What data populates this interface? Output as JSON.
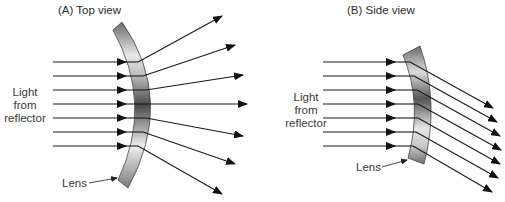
{
  "figure": {
    "panels": [
      {
        "id": "A",
        "title": "(A)  Top view",
        "source_label": [
          "Light",
          "from",
          "reflector"
        ],
        "lens_label": "Lens",
        "ray_count_in": 7,
        "ray_count_out": 7,
        "behavior": "diverging (spreads light horizontally)"
      },
      {
        "id": "B",
        "title": "(B) Side view",
        "source_label": [
          "Light",
          "from",
          "reflector"
        ],
        "lens_label": "Lens",
        "ray_count_in": 7,
        "ray_count_out": 7,
        "behavior": "deflecting downward (parallel rays bent down)"
      }
    ],
    "colors": {
      "ray": "#1a1a1a",
      "lens_dark": "#555555",
      "lens_light": "#f0f0f0",
      "text": "#3a3a3a",
      "background": "#ffffff"
    }
  }
}
